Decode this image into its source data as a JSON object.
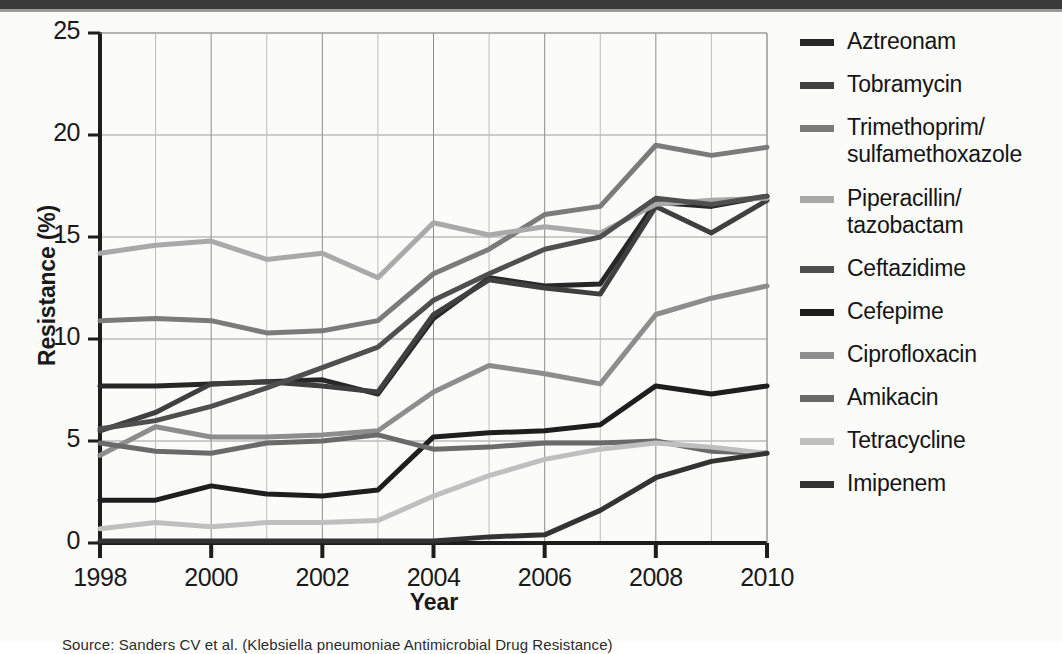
{
  "chart_data": {
    "type": "line",
    "title": "",
    "xlabel": "Year",
    "ylabel": "Resistance (%)",
    "xlim": [
      1998,
      2010
    ],
    "ylim": [
      0,
      25
    ],
    "ytick_values": [
      0,
      5,
      10,
      15,
      20,
      25
    ],
    "ytick_labels": [
      "0",
      "5",
      "10",
      "15",
      "20",
      "25"
    ],
    "xtick_values": [
      1998,
      2000,
      2002,
      2004,
      2006,
      2008,
      2010
    ],
    "xtick_labels": [
      "1998",
      "2000",
      "2002",
      "2004",
      "2006",
      "2008",
      "2010"
    ],
    "x": [
      1998,
      1999,
      2000,
      2001,
      2002,
      2003,
      2004,
      2005,
      2006,
      2007,
      2008,
      2009,
      2010
    ],
    "grid": true,
    "legend_position": "right",
    "series": [
      {
        "name": "Aztreonam",
        "color": "#272727",
        "values": [
          7.7,
          7.7,
          7.8,
          7.9,
          8.0,
          7.3,
          11.0,
          13.0,
          12.6,
          12.7,
          16.7,
          16.5,
          17.0
        ]
      },
      {
        "name": "Tobramycin",
        "color": "#3f3f3f",
        "values": [
          5.5,
          6.4,
          7.8,
          7.9,
          7.7,
          7.4,
          11.2,
          12.9,
          12.5,
          12.2,
          16.5,
          15.2,
          16.8
        ]
      },
      {
        "name": "Trimethoprim/\nsulfamethoxazole",
        "color": "#7b7b7b",
        "values": [
          10.9,
          11.0,
          10.9,
          10.3,
          10.4,
          10.9,
          13.2,
          14.4,
          16.1,
          16.5,
          19.5,
          19.0,
          19.4
        ]
      },
      {
        "name": "Piperacillin/\ntazobactam",
        "color": "#a9a9a9",
        "values": [
          14.2,
          14.6,
          14.8,
          13.9,
          14.2,
          13.0,
          15.7,
          15.1,
          15.5,
          15.2,
          16.6,
          16.8,
          16.9
        ]
      },
      {
        "name": "Ceftazidime",
        "color": "#4f4f4f",
        "values": [
          5.6,
          6.0,
          6.7,
          7.6,
          8.6,
          9.6,
          11.9,
          13.2,
          14.4,
          15.0,
          16.9,
          16.6,
          17.0
        ]
      },
      {
        "name": "Cefepime",
        "color": "#1e1e1e",
        "values": [
          2.1,
          2.1,
          2.8,
          2.4,
          2.3,
          2.6,
          5.2,
          5.4,
          5.5,
          5.8,
          7.7,
          7.3,
          7.7
        ]
      },
      {
        "name": "Ciprofloxacin",
        "color": "#8d8d8d",
        "values": [
          4.3,
          5.7,
          5.2,
          5.2,
          5.3,
          5.5,
          7.4,
          8.7,
          8.3,
          7.8,
          11.2,
          12.0,
          12.6
        ]
      },
      {
        "name": "Amikacin",
        "color": "#6a6a6a",
        "values": [
          4.9,
          4.5,
          4.4,
          4.9,
          5.0,
          5.3,
          4.6,
          4.7,
          4.9,
          4.9,
          5.0,
          4.5,
          4.4
        ]
      },
      {
        "name": "Tetracycline",
        "color": "#bfbfbf",
        "values": [
          0.7,
          1.0,
          0.8,
          1.0,
          1.0,
          1.1,
          2.3,
          3.3,
          4.1,
          4.6,
          4.9,
          4.7,
          4.4
        ]
      },
      {
        "name": "Imipenem",
        "color": "#333333",
        "values": [
          0.1,
          0.1,
          0.1,
          0.1,
          0.1,
          0.1,
          0.1,
          0.3,
          0.4,
          1.6,
          3.2,
          4.0,
          4.4
        ]
      }
    ]
  },
  "legend": {
    "items": [
      {
        "label": "Aztreonam",
        "color": "#272727"
      },
      {
        "label": "Tobramycin",
        "color": "#3f3f3f"
      },
      {
        "label": "Trimethoprim/\nsulfamethoxazole",
        "color": "#7b7b7b"
      },
      {
        "label": "Piperacillin/\ntazobactam",
        "color": "#a9a9a9"
      },
      {
        "label": "Ceftazidime",
        "color": "#4f4f4f"
      },
      {
        "label": "Cefepime",
        "color": "#1e1e1e"
      },
      {
        "label": "Ciprofloxacin",
        "color": "#8d8d8d"
      },
      {
        "label": "Amikacin",
        "color": "#6a6a6a"
      },
      {
        "label": "Tetracycline",
        "color": "#bfbfbf"
      },
      {
        "label": "Imipenem",
        "color": "#333333"
      }
    ]
  },
  "caption": {
    "text": "Source: Sanders CV et al. (Klebsiella pneumoniae Antimicrobial Drug Resistance)"
  }
}
